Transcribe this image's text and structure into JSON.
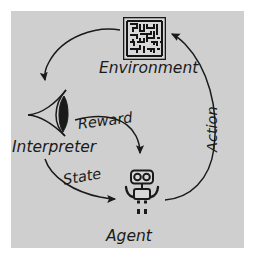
{
  "diagram": {
    "background_color": "#ffffff",
    "panel_color": "#cfcfcf",
    "ink_color": "#1a1a1a",
    "nodes": [
      {
        "id": "environment",
        "label": "Environment",
        "icon": "maze-icon"
      },
      {
        "id": "interpreter",
        "label": "Interpreter",
        "icon": "eye-icon"
      },
      {
        "id": "agent",
        "label": "Agent",
        "icon": "robot-icon"
      }
    ],
    "edges": [
      {
        "id": "environment-to-interpreter",
        "label": "",
        "from": "environment",
        "to": "interpreter"
      },
      {
        "id": "interpreter-to-agent-reward",
        "label": "Reward",
        "from": "interpreter",
        "to": "agent"
      },
      {
        "id": "interpreter-to-agent-state",
        "label": "State",
        "from": "interpreter",
        "to": "agent"
      },
      {
        "id": "agent-to-environment-action",
        "label": "Action",
        "from": "agent",
        "to": "environment"
      }
    ]
  }
}
